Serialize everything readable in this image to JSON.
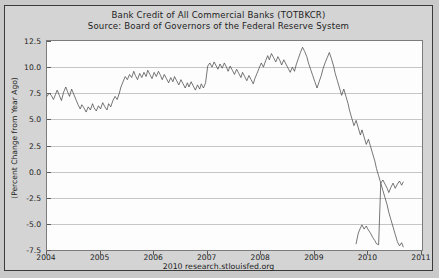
{
  "chart_data": {
    "type": "line",
    "title": "Bank Credit of All Commercial Banks (TOTBKCR)",
    "subtitle": "Source: Board of Governors of the Federal Reserve System",
    "xlabel": "",
    "ylabel": "(Percent Change from Year Ago)",
    "footer": "2010 research.stlouisfed.org",
    "grid": true,
    "legend": "none",
    "xlim": [
      2004.0,
      2011.0
    ],
    "ylim": [
      -7.5,
      12.5
    ],
    "yticks": [
      12.5,
      10.0,
      7.5,
      5.0,
      2.5,
      0.0,
      -2.5,
      -5.0,
      -7.5
    ],
    "ytick_labels": [
      "12.5",
      "10.0",
      "7.5",
      "5.0",
      "2.5",
      "0.0",
      "-2.5",
      "-5.0",
      "-7.5"
    ],
    "xticks": [
      2004,
      2005,
      2006,
      2007,
      2008,
      2009,
      2010,
      2011
    ],
    "xtick_labels": [
      "2004",
      "2005",
      "2006",
      "2007",
      "2008",
      "2009",
      "2010",
      "2011"
    ],
    "line_color": "#4a4a4a",
    "plot_background": "#fdfdfd",
    "figure_background": "#d4d4d4",
    "series": [
      {
        "name": "TOTBKCR percent change from year ago",
        "x": [
          2004.0,
          2004.04,
          2004.08,
          2004.12,
          2004.16,
          2004.19,
          2004.23,
          2004.27,
          2004.31,
          2004.35,
          2004.38,
          2004.42,
          2004.46,
          2004.5,
          2004.54,
          2004.58,
          2004.62,
          2004.65,
          2004.69,
          2004.73,
          2004.77,
          2004.81,
          2004.85,
          2004.88,
          2004.92,
          2004.96,
          2005.0,
          2005.04,
          2005.08,
          2005.12,
          2005.15,
          2005.19,
          2005.23,
          2005.27,
          2005.31,
          2005.35,
          2005.38,
          2005.42,
          2005.46,
          2005.5,
          2005.54,
          2005.58,
          2005.62,
          2005.65,
          2005.69,
          2005.73,
          2005.77,
          2005.81,
          2005.85,
          2005.88,
          2005.92,
          2005.96,
          2006.0,
          2006.04,
          2006.08,
          2006.12,
          2006.15,
          2006.19,
          2006.23,
          2006.27,
          2006.31,
          2006.35,
          2006.38,
          2006.42,
          2006.46,
          2006.5,
          2006.54,
          2006.58,
          2006.62,
          2006.65,
          2006.69,
          2006.73,
          2006.77,
          2006.81,
          2006.85,
          2006.88,
          2006.92,
          2006.96,
          2007.0,
          2007.04,
          2007.08,
          2007.12,
          2007.15,
          2007.19,
          2007.23,
          2007.27,
          2007.31,
          2007.35,
          2007.38,
          2007.42,
          2007.46,
          2007.5,
          2007.54,
          2007.58,
          2007.62,
          2007.65,
          2007.69,
          2007.73,
          2007.77,
          2007.81,
          2007.85,
          2007.88,
          2007.92,
          2007.96,
          2008.0,
          2008.04,
          2008.08,
          2008.12,
          2008.15,
          2008.19,
          2008.23,
          2008.27,
          2008.31,
          2008.35,
          2008.38,
          2008.42,
          2008.46,
          2008.5,
          2008.54,
          2008.58,
          2008.62,
          2008.65,
          2008.69,
          2008.73,
          2008.77,
          2008.81,
          2008.85,
          2008.88,
          2008.92,
          2008.96,
          2009.0,
          2009.04,
          2009.08,
          2009.12,
          2009.15,
          2009.19,
          2009.23,
          2009.27,
          2009.31,
          2009.35,
          2009.38,
          2009.42,
          2009.46,
          2009.5,
          2009.54,
          2009.58,
          2009.62,
          2009.65,
          2009.69,
          2009.73,
          2009.77,
          2009.81,
          2009.85,
          2009.88,
          2009.92,
          2009.96,
          2010.0,
          2010.04,
          2010.08,
          2010.12,
          2010.15,
          2010.19,
          2010.23,
          2010.27,
          2010.31,
          2010.35,
          2010.38,
          2010.42,
          2010.46,
          2010.5,
          2010.54,
          2010.58,
          2010.62,
          2010.65
        ],
        "values": [
          7.2,
          7.5,
          7.3,
          6.9,
          7.4,
          7.8,
          7.3,
          6.8,
          7.6,
          8.1,
          7.7,
          7.2,
          7.9,
          7.4,
          6.9,
          6.4,
          6.0,
          6.4,
          6.1,
          5.7,
          6.2,
          5.9,
          6.5,
          6.1,
          5.8,
          6.3,
          6.0,
          6.6,
          6.2,
          5.9,
          6.5,
          6.2,
          6.8,
          7.2,
          6.9,
          7.5,
          8.1,
          8.6,
          9.1,
          8.8,
          9.3,
          9.0,
          9.6,
          9.2,
          8.8,
          9.4,
          9.0,
          9.5,
          9.1,
          9.7,
          9.3,
          8.9,
          9.5,
          9.1,
          9.6,
          9.2,
          8.8,
          9.3,
          8.9,
          8.5,
          9.0,
          8.6,
          9.1,
          8.7,
          8.3,
          8.8,
          8.4,
          8.0,
          8.5,
          8.1,
          8.6,
          8.2,
          7.8,
          8.3,
          7.9,
          8.4,
          8.0,
          8.5,
          10.1,
          10.4,
          10.0,
          10.5,
          10.2,
          9.8,
          10.3,
          9.9,
          10.4,
          10.0,
          9.6,
          10.1,
          9.7,
          9.3,
          9.8,
          9.4,
          9.0,
          9.5,
          9.1,
          8.7,
          9.2,
          8.8,
          8.4,
          8.9,
          9.4,
          9.9,
          10.4,
          10.0,
          10.6,
          11.1,
          10.7,
          11.3,
          10.9,
          10.5,
          11.0,
          10.6,
          10.2,
          10.7,
          10.3,
          9.9,
          9.5,
          10.0,
          9.6,
          10.2,
          10.8,
          11.4,
          11.9,
          11.5,
          11.0,
          10.4,
          9.8,
          9.2,
          8.6,
          8.0,
          8.6,
          9.2,
          9.8,
          10.4,
          10.9,
          11.4,
          10.8,
          10.1,
          9.4,
          8.7,
          8.0,
          7.3,
          7.9,
          7.2,
          6.5,
          5.8,
          5.1,
          4.4,
          4.9,
          4.2,
          3.5,
          4.0,
          3.3,
          2.6,
          3.1,
          2.4,
          1.7,
          1.0,
          0.3,
          -0.4,
          -1.1,
          -1.8,
          -2.5,
          -3.2,
          -3.9,
          -4.6,
          -5.3,
          -6.0,
          -6.7,
          -7.1,
          -6.8,
          -7.2
        ]
      },
      {
        "name": "recovery-tail",
        "x": [
          2009.77,
          2009.81,
          2009.85,
          2009.88,
          2009.92,
          2009.96,
          2010.0,
          2010.04,
          2010.08,
          2010.12,
          2010.15,
          2010.19,
          2010.23,
          2010.27,
          2010.31,
          2010.35,
          2010.38,
          2010.42,
          2010.46,
          2010.5,
          2010.54,
          2010.58,
          2010.62,
          2010.65
        ],
        "values": [
          -6.9,
          -5.9,
          -5.4,
          -5.1,
          -5.5,
          -5.2,
          -5.6,
          -5.9,
          -6.3,
          -6.6,
          -6.9,
          -7.0,
          -1.1,
          -0.8,
          -1.2,
          -1.6,
          -2.0,
          -1.5,
          -1.1,
          -1.6,
          -1.2,
          -0.9,
          -1.3,
          -1.0
        ]
      }
    ]
  }
}
